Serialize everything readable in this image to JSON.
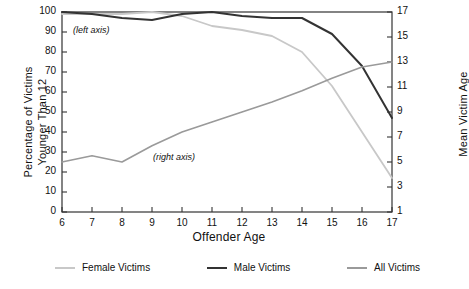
{
  "chart_data": {
    "type": "line",
    "title": "",
    "xlabel": "Offender Age",
    "ylabel": "Percentage of Victims Younger Than 12",
    "ylabel_line1": "Percentage of Victims",
    "ylabel_line2": "Younger Than 12",
    "y2label": "Mean Victim Age",
    "x": [
      6,
      7,
      8,
      9,
      10,
      11,
      12,
      13,
      14,
      15,
      16,
      17
    ],
    "xlim": [
      6,
      17
    ],
    "ylim": [
      0,
      100
    ],
    "y2lim": [
      1,
      17
    ],
    "xticks": [
      "6",
      "7",
      "8",
      "9",
      "10",
      "11",
      "12",
      "13",
      "14",
      "15",
      "16",
      "17"
    ],
    "yticks": [
      "0",
      "10",
      "20",
      "30",
      "40",
      "50",
      "60",
      "70",
      "80",
      "90",
      "100"
    ],
    "y2ticks": [
      "1",
      "3",
      "5",
      "7",
      "9",
      "11",
      "13",
      "15",
      "17"
    ],
    "grid": false,
    "legend_position": "bottom",
    "annotations": [
      {
        "text": "(left axis)",
        "x": 7.0,
        "y": 90
      },
      {
        "text": "(right axis)",
        "x": 9.6,
        "y": 31
      }
    ],
    "series": [
      {
        "name": "Female Victims",
        "axis": "left",
        "color": "#c8c8c8",
        "values": [
          99,
          99,
          99,
          100,
          98,
          93,
          91,
          88,
          80,
          63,
          40,
          17
        ]
      },
      {
        "name": "Male Victims",
        "axis": "left",
        "color": "#333333",
        "values": [
          100,
          99,
          97,
          96,
          99,
          100,
          98,
          97,
          97,
          89,
          73,
          47
        ]
      },
      {
        "name": "All Victims",
        "axis": "right",
        "color": "#9a9a9a",
        "values": [
          5.0,
          5.5,
          5.0,
          6.3,
          7.4,
          8.2,
          9.0,
          9.8,
          10.7,
          11.7,
          12.6,
          13.0
        ]
      }
    ]
  },
  "legend": [
    {
      "label": "Female Victims",
      "color": "#c8c8c8"
    },
    {
      "label": "Male Victims",
      "color": "#333333"
    },
    {
      "label": "All Victims",
      "color": "#9a9a9a"
    }
  ]
}
